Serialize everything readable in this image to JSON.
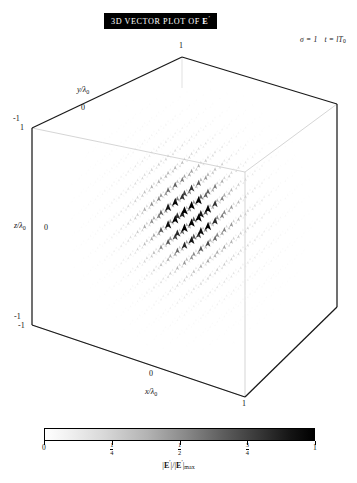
{
  "figure": {
    "title": "3D VECTOR PLOT OF",
    "title_symbol": "E",
    "title_symbol_prime": "′",
    "annotation": {
      "sigma": "σ = 1",
      "time": "t = lT",
      "time_sub": "0"
    }
  },
  "axes": {
    "x": {
      "label": "x/λ",
      "label_sub": "0",
      "ticks": [
        "-1",
        "0",
        "1"
      ]
    },
    "y": {
      "label": "y/λ",
      "label_sub": "0",
      "ticks": [
        "-1",
        "0",
        "1"
      ]
    },
    "z": {
      "label": "z/λ",
      "label_sub": "0",
      "ticks": [
        "-1",
        "0",
        "1"
      ]
    }
  },
  "tick_labels": {
    "y_top": "1",
    "y_mid": "0",
    "y_left_neg": "-1",
    "z_top": "1",
    "z_mid": "0",
    "z_bot": "-1",
    "x_left_neg": "-1",
    "x_mid": "0",
    "x_right": "1",
    "x_front": "1"
  },
  "colorbar": {
    "orientation": "horizontal",
    "low_color": "#ffffff",
    "high_color": "#000000",
    "label_num": "E",
    "label_prime": "′",
    "label_sub": "max",
    "ticks": [
      {
        "value": 0,
        "text": "0",
        "type": "plain",
        "pos": 0
      },
      {
        "value": 0.25,
        "text": "1/4",
        "type": "fraction",
        "num": "1",
        "den": "4",
        "pos": 25
      },
      {
        "value": 0.5,
        "text": "1/2",
        "type": "fraction",
        "num": "1",
        "den": "2",
        "pos": 50
      },
      {
        "value": 0.75,
        "text": "3/4",
        "type": "fraction",
        "num": "3",
        "den": "4",
        "pos": 75
      },
      {
        "value": 1,
        "text": "1",
        "type": "plain",
        "pos": 100
      }
    ]
  },
  "chart_data": {
    "type": "scatter",
    "subtype": "3d-vector-field",
    "title": "3D VECTOR PLOT OF E′",
    "xlabel": "x/λ0",
    "ylabel": "y/λ0",
    "zlabel": "z/λ0",
    "xlim": [
      -1,
      1
    ],
    "ylim": [
      -1,
      1
    ],
    "zlim": [
      -1,
      1
    ],
    "grid": false,
    "legend": null,
    "colormap": "grayscale-white-to-black",
    "color_label": "|E′|/|E′|max",
    "color_range": [
      0,
      1
    ],
    "color_ticks": [
      0,
      0.25,
      0.5,
      0.75,
      1
    ],
    "annotations": [
      "σ = 1",
      "t = lT0"
    ],
    "field_description": "Arrow/cone glyphs on a regular 3D lattice; magnitude encoded by grayscale darkness, concentrated in a lobe near the cube centre slightly right and below centre; magnitude decays toward the cube faces.",
    "peak_location": [
      0.12,
      0.0,
      -0.05
    ],
    "peak_value": 1.0,
    "samples": [
      {
        "x": 0.12,
        "y": 0.0,
        "z": -0.05,
        "mag": 1.0
      },
      {
        "x": 0.0,
        "y": 0.0,
        "z": 0.0,
        "mag": 0.92
      },
      {
        "x": 0.3,
        "y": 0.0,
        "z": -0.1,
        "mag": 0.78
      },
      {
        "x": -0.25,
        "y": 0.0,
        "z": 0.05,
        "mag": 0.55
      },
      {
        "x": 0.12,
        "y": 0.35,
        "z": -0.05,
        "mag": 0.48
      },
      {
        "x": 0.12,
        "y": -0.35,
        "z": -0.05,
        "mag": 0.46
      },
      {
        "x": 0.55,
        "y": 0.0,
        "z": -0.15,
        "mag": 0.32
      },
      {
        "x": -0.55,
        "y": 0.0,
        "z": 0.1,
        "mag": 0.22
      },
      {
        "x": 0.12,
        "y": 0.0,
        "z": -0.55,
        "mag": 0.2
      },
      {
        "x": 0.12,
        "y": 0.0,
        "z": 0.5,
        "mag": 0.18
      },
      {
        "x": 0.85,
        "y": 0.0,
        "z": -0.2,
        "mag": 0.09
      },
      {
        "x": -0.85,
        "y": 0.0,
        "z": 0.15,
        "mag": 0.06
      },
      {
        "x": 0.0,
        "y": 0.85,
        "z": 0.0,
        "mag": 0.05
      },
      {
        "x": 0.0,
        "y": -0.85,
        "z": 0.0,
        "mag": 0.05
      }
    ]
  }
}
